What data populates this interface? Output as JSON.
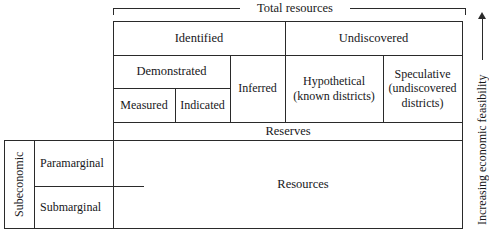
{
  "figure": {
    "type": "mckelvey-box",
    "total_bracket_label": "Total resources",
    "vertical_axis_label": "Increasing economic feasibility",
    "columns": {
      "identified": "Identified",
      "undiscovered": "Undiscovered",
      "demonstrated": "Demonstrated",
      "measured": "Measured",
      "indicated": "Indicated",
      "inferred": "Inferred",
      "hypothetical_line1": "Hypothetical",
      "hypothetical_line2": "(known districts)",
      "speculative_line1": "Speculative",
      "speculative_line2": "(undiscovered",
      "speculative_line3": "districts)"
    },
    "rows": {
      "reserves": "Reserves",
      "resources": "Resources",
      "subeconomic": "Subeconomic",
      "paramarginal": "Paramarginal",
      "submarginal": "Submarginal"
    },
    "colors": {
      "line": "#2a2a2a",
      "text": "#17171a",
      "background": "#ffffff"
    }
  }
}
